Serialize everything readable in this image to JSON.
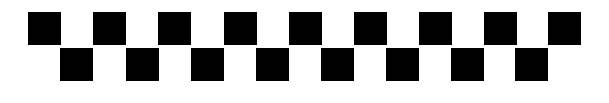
{
  "pattern": {
    "description": "Two-row staggered checkerboard strip of black squares",
    "square_color": "#000000",
    "background_color": "#ffffff",
    "square_size": 33,
    "rows": [
      {
        "name": "top",
        "y": 12,
        "x": [
          28,
          93,
          158,
          224,
          289,
          354,
          419,
          484,
          548
        ]
      },
      {
        "name": "bottom",
        "y": 48,
        "x": [
          60,
          126,
          191,
          256,
          321,
          386,
          451,
          515
        ]
      }
    ]
  }
}
